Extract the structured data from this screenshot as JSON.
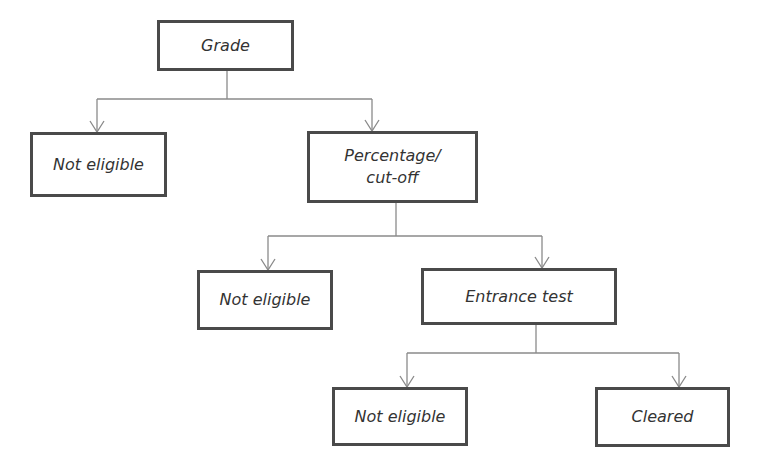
{
  "diagram": {
    "type": "decision-flowchart",
    "colors": {
      "box_border": "#4a4a4a",
      "text": "#333333",
      "connector": "#8a8a8a",
      "background": "#ffffff"
    },
    "nodes": {
      "grade": {
        "label": "Grade"
      },
      "not_eligible_1": {
        "label": "Not eligible"
      },
      "percentage": {
        "label": "Percentage/\ncut-off"
      },
      "not_eligible_2": {
        "label": "Not eligible"
      },
      "entrance_test": {
        "label": "Entrance test"
      },
      "not_eligible_3": {
        "label": "Not eligible"
      },
      "cleared": {
        "label": "Cleared"
      }
    },
    "edges": [
      {
        "from": "grade",
        "to": "not_eligible_1"
      },
      {
        "from": "grade",
        "to": "percentage"
      },
      {
        "from": "percentage",
        "to": "not_eligible_2"
      },
      {
        "from": "percentage",
        "to": "entrance_test"
      },
      {
        "from": "entrance_test",
        "to": "not_eligible_3"
      },
      {
        "from": "entrance_test",
        "to": "cleared"
      }
    ]
  }
}
